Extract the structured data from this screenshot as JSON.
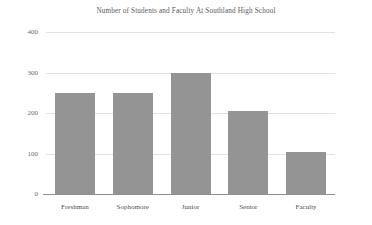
{
  "chart_data": {
    "type": "bar",
    "title": "Number of Students and Faculty At Southland High School",
    "subtitle": "",
    "xlabel": "",
    "ylabel": "",
    "categories": [
      "Freshman",
      "Sophomore",
      "Junior",
      "Senior",
      "Faculty"
    ],
    "values": [
      250,
      250,
      300,
      205,
      105
    ],
    "series": [
      {
        "name": "Count",
        "values": [
          250,
          250,
          300,
          205,
          105
        ]
      }
    ],
    "ylim": [
      0,
      400
    ],
    "yticks": [
      0,
      100,
      200,
      300,
      400
    ],
    "ytick_labels": [
      "0",
      "100",
      "200",
      "300",
      "400"
    ],
    "grid": true,
    "legend": false,
    "legend_position": "none",
    "bar_color": "#949494",
    "gridline_color": "#e2e2e2",
    "axis_color": "#8f8f8f",
    "title_color": "#595959",
    "tick_label_color": "#4f4f4f",
    "background_color": "#ffffff"
  }
}
